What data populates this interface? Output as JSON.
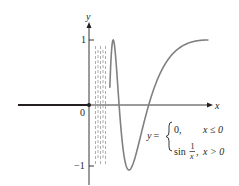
{
  "chart_data": {
    "type": "line",
    "title": "",
    "function": "y = { 0, x ≤ 0 ; sin(1/x), x > 0 }",
    "xlabel": "x",
    "ylabel": "y",
    "y_ticks": [
      {
        "value": 1,
        "label": "1"
      },
      {
        "value": -1,
        "label": "−1"
      }
    ],
    "origin_label": "0",
    "ylim": [
      -1,
      1
    ],
    "series": [
      {
        "name": "y = 0 for x ≤ 0",
        "segment": "left",
        "y": 0
      },
      {
        "name": "y = sin(1/x) for x > 0",
        "segment": "right",
        "x_max": 0.6366,
        "notes": "oscillates infinitely near x = 0, shown with dashed lines"
      }
    ],
    "key_points": [
      {
        "x": 0.6366,
        "y": 1,
        "note": "1/x = π/2"
      },
      {
        "x": 0.3183,
        "y": 0,
        "note": "1/x = π"
      },
      {
        "x": 0.2122,
        "y": -1,
        "note": "1/x = 3π/2"
      },
      {
        "x": 0.1592,
        "y": 0,
        "note": "1/x = 2π"
      },
      {
        "x": 0.1273,
        "y": 1,
        "note": "1/x = 5π/2"
      }
    ]
  },
  "labels": {
    "x_axis": "x",
    "y_axis": "y",
    "origin": "0",
    "tick_pos_one": "1",
    "tick_neg_one": "−1",
    "equation": {
      "lhs": "y =",
      "case1_expr": "0,",
      "case1_cond": "x ≤ 0",
      "case2_fn": "sin",
      "case2_num": "1",
      "case2_den": "x",
      "case2_comma": ",",
      "case2_cond": "x > 0"
    }
  },
  "colors": {
    "axis": "#231f20",
    "curve": "#808080",
    "dashed": "#9a9a9a"
  }
}
